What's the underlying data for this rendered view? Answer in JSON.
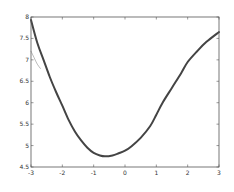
{
  "chart_data": {
    "type": "line",
    "title": "",
    "xlabel": "",
    "ylabel": "",
    "xlim": [
      -3,
      3
    ],
    "ylim": [
      4.5,
      8
    ],
    "xticks": [
      -3,
      -2,
      -1,
      0,
      1,
      2,
      3
    ],
    "xtick_labels": [
      "-3",
      "-2",
      "-1",
      "0",
      "1",
      "2",
      "3"
    ],
    "yticks": [
      4.5,
      5,
      5.5,
      6,
      6.5,
      7,
      7.5,
      8
    ],
    "ytick_labels": [
      "4.5",
      "5",
      "5.5",
      "6",
      "6.5",
      "7",
      "7.5",
      "8"
    ],
    "grid": false,
    "box": true,
    "legend": null,
    "series": [
      {
        "name": "main curve",
        "color": "#444444",
        "width": 2,
        "x": [
          -3,
          -2.8,
          -2.6,
          -2.4,
          -2.2,
          -2.0,
          -1.8,
          -1.6,
          -1.4,
          -1.2,
          -1.0,
          -0.8,
          -0.64,
          -0.4,
          -0.2,
          0,
          0.2,
          0.5,
          0.8,
          1.0,
          1.2,
          1.5,
          1.8,
          2.0,
          2.3,
          2.6,
          3.0
        ],
        "y": [
          7.93,
          7.4,
          7.0,
          6.6,
          6.25,
          5.93,
          5.6,
          5.33,
          5.12,
          4.95,
          4.83,
          4.77,
          4.75,
          4.77,
          4.82,
          4.88,
          4.98,
          5.18,
          5.45,
          5.72,
          6.0,
          6.35,
          6.7,
          6.95,
          7.2,
          7.42,
          7.65
        ]
      },
      {
        "name": "secondary curve",
        "color": "#aaaaaa",
        "width": 0.8,
        "x": [
          -3,
          -2.9,
          -2.8,
          -2.7
        ],
        "y": [
          7.2,
          7.05,
          6.9,
          6.8
        ]
      }
    ]
  },
  "axes": {
    "left": 31,
    "top": 17,
    "right": 219,
    "bottom": 167,
    "frame_color": "#555555",
    "background": "#ffffff"
  }
}
